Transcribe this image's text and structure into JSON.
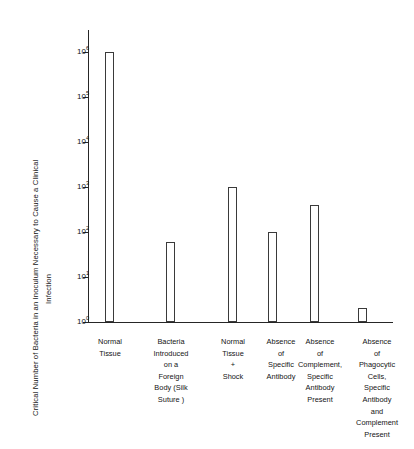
{
  "chart_data": {
    "type": "bar",
    "title": "",
    "xlabel": "",
    "ylabel": "Critical Number of Bacteria in an Inoculum Necessary to Cause a Clinical Infection",
    "yscale": "log",
    "ylim": [
      1,
      1000000
    ],
    "ytick_labels": [
      "10⁶",
      "10⁵",
      "10⁴",
      "10³",
      "10²",
      "10¹",
      "10⁰"
    ],
    "ytick_values": [
      1000000,
      100000,
      10000,
      1000,
      100,
      10,
      1
    ],
    "ytick_mantissas": [
      "10",
      "10",
      "10",
      "10",
      "10",
      "10",
      "10"
    ],
    "ytick_exponents": [
      "6",
      "5",
      "4",
      "3",
      "2",
      "1",
      "0"
    ],
    "grid": false,
    "legend": false,
    "categories": [
      "Normal Tissue",
      "Bacteria Introduced on a Foreign Body (Silk Suture )",
      "Normal Tissue + Shock",
      "Absence of Specific Antibody",
      "Absence of Complement, Specific Antibody Present",
      "Absence of Phagocytic Cells, Specific Antibody and Complement Present"
    ],
    "category_lines": [
      [
        "Normal",
        "Tissue"
      ],
      [
        "Bacteria",
        "Introduced",
        "on a",
        "Foreign",
        "Body (Silk",
        "Suture )"
      ],
      [
        "Normal",
        "Tissue",
        "+",
        "Shock"
      ],
      [
        "Absence",
        "of",
        "Specific",
        "Antibody"
      ],
      [
        "Absence",
        "of",
        "Complement,",
        "Specific",
        "Antibody",
        "Present"
      ],
      [
        "Absence",
        "of",
        "Phagocytic",
        "Cells,",
        "Specific",
        "Antibody",
        "and",
        "Complement",
        "Present"
      ]
    ],
    "values": [
      1000000,
      60,
      1000,
      100,
      400,
      2
    ],
    "value_labels": [
      "10⁶",
      "6×10¹",
      "10³",
      "10²",
      "4×10²",
      "2"
    ]
  },
  "ylabel_lines": [
    "Critical Number of Bacteria in an Inoculum Necessary to Cause a Clinical",
    "Infection"
  ],
  "colors": {
    "axis": "#262626",
    "bar_edge": "#3a3a3a",
    "bar_fill": "#ffffff",
    "text": "#141414",
    "background": "#ffffff"
  }
}
